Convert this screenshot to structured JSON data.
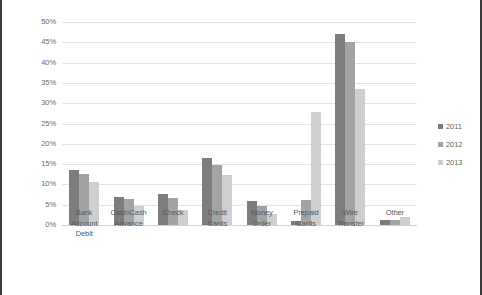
{
  "chart_data": {
    "type": "bar",
    "title": "",
    "subtitle": "",
    "xlabel": "",
    "ylabel": "",
    "ylim": [
      0,
      50
    ],
    "ytick_step": 5,
    "ytick_labels": [
      "0%",
      "5%",
      "10%",
      "15%",
      "20%",
      "25%",
      "30%",
      "35%",
      "40%",
      "45%",
      "50%"
    ],
    "grid": true,
    "legend_position": "right",
    "categories": [
      "Bank Account Debit",
      "Cash\\Cash Advance",
      "Check",
      "Credit Cards",
      "Money Order",
      "Prepaid Cards",
      "Wire Transfer",
      "Other"
    ],
    "category_lines": [
      [
        "Bank",
        "Account",
        "Debit"
      ],
      [
        "Cash\\Cash",
        "Advance"
      ],
      [
        "Check"
      ],
      [
        "Credit",
        "Cards"
      ],
      [
        "Money",
        "Order"
      ],
      [
        "Prepaid",
        "Cards"
      ],
      [
        "Wire",
        "Transfer"
      ],
      [
        "Other"
      ]
    ],
    "series": [
      {
        "name": "2011",
        "color": "#7d7d7d",
        "values": [
          13.5,
          6.8,
          7.6,
          16.5,
          5.8,
          0.9,
          47.0,
          1.2
        ]
      },
      {
        "name": "2012",
        "color": "#a3a3a3",
        "values": [
          12.6,
          6.4,
          6.6,
          14.7,
          4.6,
          6.2,
          45.2,
          1.3
        ]
      },
      {
        "name": "2013",
        "color": "#cfcfcf",
        "values": [
          10.6,
          4.7,
          3.6,
          12.2,
          2.6,
          27.8,
          33.4,
          1.9
        ]
      }
    ]
  },
  "legend": {
    "entries": [
      {
        "label": "2011",
        "color": "#7d7d7d"
      },
      {
        "label": "2012",
        "color": "#a3a3a3"
      },
      {
        "label": "2013",
        "color": "#cfcfcf"
      }
    ]
  },
  "colors": {
    "series_2011": "#7d7d7d",
    "series_2012": "#a3a3a3",
    "series_2013": "#cfcfcf",
    "gridline": "#e3e3e3",
    "frame_border": "#3a3a3a",
    "tick_text": "#6b6b6b",
    "background": "#ffffff"
  }
}
